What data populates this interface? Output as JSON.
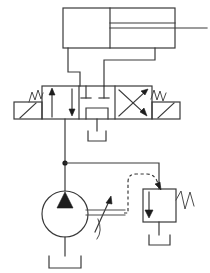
{
  "diagram": {
    "type": "hydraulic-schematic",
    "background_color": "#ffffff",
    "line_color": "#3a3a3a",
    "accent_color": "#1d1d1d",
    "canvas": {
      "width": 210,
      "height": 273
    }
  },
  "components": {
    "cylinder": {
      "name": "double-acting-cylinder",
      "label": "",
      "body": {
        "x": 63,
        "y": 8,
        "width": 112,
        "height": 40
      },
      "piston_x": 110,
      "rod": {
        "from_x": 110,
        "to_x": 207,
        "y": 28
      },
      "port_cap": {
        "x": 68,
        "y": 48
      },
      "port_rod": {
        "x": 155,
        "y": 48
      }
    },
    "directional_valve": {
      "name": "three-position-four-way-valve",
      "label": "",
      "positions": 3,
      "body": {
        "x": 42,
        "y": 86,
        "width": 110,
        "height": 33
      },
      "position_left": {
        "symbol": "parallel-arrows",
        "arrow_up_x": 52,
        "arrow_down_x": 73
      },
      "position_center": {
        "symbol": "closed-center-tandem",
        "description": "blocked service ports, pressure to tank"
      },
      "position_right": {
        "symbol": "crossed-arrows"
      },
      "actuator_left": {
        "symbol": "manual-lever",
        "spring": "spring-zigzag"
      },
      "actuator_right": {
        "symbol": "manual-lever",
        "spring": "spring-zigzag"
      },
      "ports": {
        "A_x": 80,
        "B_x": 104,
        "P_x": 92,
        "T_x": 92
      }
    },
    "pump": {
      "name": "variable-displacement-pump",
      "label": "",
      "center": {
        "cx": 92,
        "cy": 214
      },
      "radius": 23,
      "flow_arrow": "filled-triangle-up",
      "variable_arrow": "diagonal-arrow",
      "control_lines": 2
    },
    "relief_valve": {
      "name": "pressure-relief-valve",
      "label": "",
      "body": {
        "x": 143,
        "y": 189,
        "width": 33,
        "height": 33
      },
      "internal_arrow": "down-arrow",
      "spring": "spring-zigzag-right",
      "pilot_line": "dashed-remote-pilot"
    },
    "tanks": [
      {
        "name": "tank-valve-drain",
        "x": 92,
        "y": 141
      },
      {
        "name": "tank-pump-suction",
        "x": 92,
        "y": 252
      },
      {
        "name": "tank-relief-return",
        "x": 159,
        "y": 237
      }
    ],
    "junctions": [
      {
        "name": "pressure-line-junction",
        "x": 65,
        "y": 163
      }
    ],
    "lines": {
      "cylinder_cap_to_valve": "vertical from cylinder cap port down to valve port A",
      "cylinder_rod_to_valve": "from cylinder rod port down to valve port B",
      "pump_to_valve": "vertical pressure line from pump to valve port P",
      "pump_to_relief": "branch from pressure line to relief valve inlet"
    }
  }
}
